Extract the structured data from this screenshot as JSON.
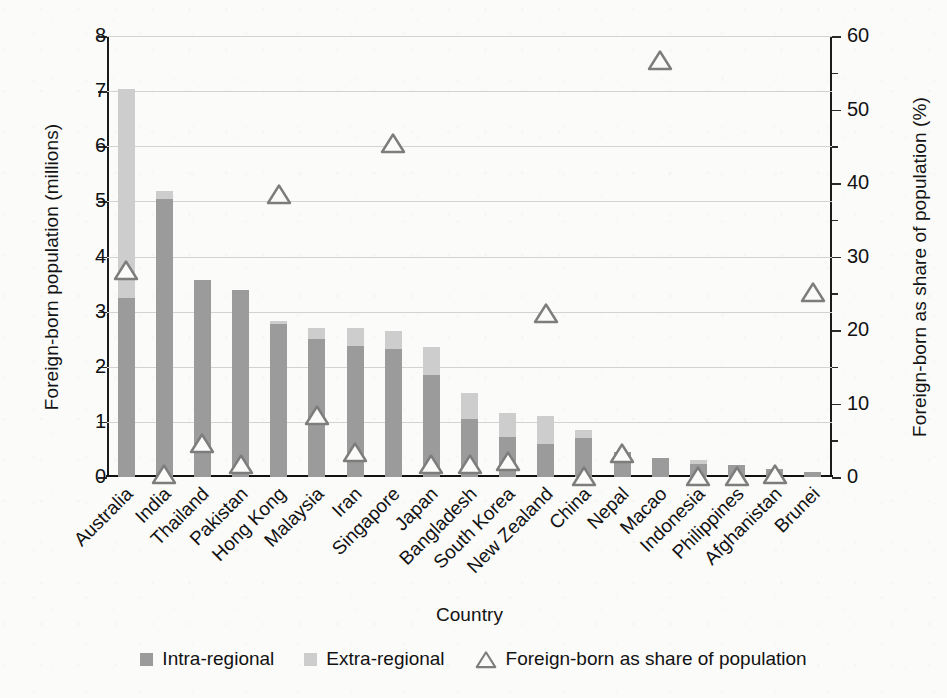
{
  "chart_data": {
    "type": "bar",
    "title": "",
    "subtitle": "",
    "xlabel": "Country",
    "ylabel": "Foreign-born population (millions)",
    "ylabel_secondary": "Foreign-born as share of population (%)",
    "ylim": [
      0,
      8
    ],
    "ylim_secondary": [
      0,
      60
    ],
    "yticks": [
      0,
      1,
      2,
      3,
      4,
      5,
      6,
      7,
      8
    ],
    "yticks_secondary": [
      0,
      10,
      20,
      30,
      40,
      50,
      60
    ],
    "grid": true,
    "legend_position": "bottom",
    "stacked": true,
    "categories": [
      "Australia",
      "India",
      "Thailand",
      "Pakistan",
      "Hong Kong",
      "Malaysia",
      "Iran",
      "Singapore",
      "Japan",
      "Bangladesh",
      "South Korea",
      "New Zealand",
      "China",
      "Nepal",
      "Macao",
      "Indonesia",
      "Philippines",
      "Afghanistan",
      "Brunei"
    ],
    "series": [
      {
        "name": "Intra-regional",
        "axis": "left",
        "unit": "millions",
        "color": "#9b9b9b",
        "values": [
          3.25,
          5.05,
          3.57,
          3.4,
          2.78,
          2.5,
          2.38,
          2.33,
          1.85,
          1.05,
          0.73,
          0.6,
          0.7,
          0.45,
          0.34,
          0.24,
          0.21,
          0.15,
          0.1
        ]
      },
      {
        "name": "Extra-regional",
        "axis": "left",
        "unit": "millions",
        "color": "#cdcdcd",
        "values": [
          3.78,
          0.13,
          0.0,
          0.0,
          0.05,
          0.21,
          0.32,
          0.32,
          0.5,
          0.47,
          0.44,
          0.5,
          0.15,
          0.0,
          0.0,
          0.07,
          0.0,
          0.0,
          0.0
        ]
      },
      {
        "name": "Foreign-born as share of population",
        "axis": "right",
        "unit": "%",
        "marker": "triangle-open",
        "color": "#7d7d7d",
        "values": [
          28.2,
          0.4,
          4.6,
          1.8,
          38.5,
          8.4,
          3.4,
          45.5,
          1.8,
          1.8,
          2.2,
          22.3,
          0.1,
          3.3,
          56.8,
          0.1,
          0.2,
          0.4,
          25.2
        ]
      }
    ],
    "totals_millions": [
      7.03,
      5.18,
      3.57,
      3.4,
      2.83,
      2.71,
      2.7,
      2.65,
      2.35,
      1.52,
      1.17,
      1.1,
      0.85,
      0.45,
      0.34,
      0.31,
      0.21,
      0.15,
      0.1
    ]
  },
  "legend": {
    "items": [
      {
        "label": "Intra-regional",
        "icon": "square-swatch-dark"
      },
      {
        "label": "Extra-regional",
        "icon": "square-swatch-light"
      },
      {
        "label": "Foreign-born as share of population",
        "icon": "triangle-outline-marker"
      }
    ]
  },
  "colors": {
    "intra_regional": "#9b9b9b",
    "extra_regional": "#cdcdcd",
    "marker_outline": "#7d7d7d",
    "axis": "#1b1b1b",
    "gridline": "#d3d3d3",
    "background": "#fbfbfa"
  }
}
